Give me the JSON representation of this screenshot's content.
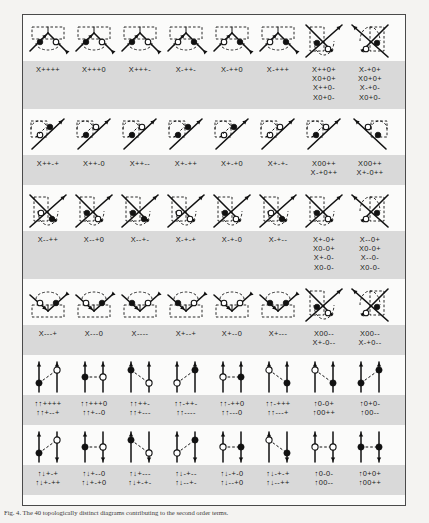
{
  "figure": {
    "caption": "Fig. 4. The 40 topologically distinct diagrams contributing to the second order terms.",
    "frame_color": "#4a4a4a",
    "band_color": "#d9d9d9",
    "paper_color": "#f4f3f1",
    "ink_color": "#111111"
  },
  "groups": [
    {
      "id": "group-1",
      "band": "gray",
      "diagrams": [
        {
          "id": "d1",
          "kind": "vertex-pair",
          "a": "filled",
          "b": "open",
          "arc": "below"
        },
        {
          "id": "d2",
          "kind": "vertex-pair",
          "a": "filled",
          "b": "open",
          "arc": "below"
        },
        {
          "id": "d3",
          "kind": "vertex-pair",
          "a": "filled",
          "b": "open",
          "arc": "below"
        },
        {
          "id": "d4",
          "kind": "vertex-pair",
          "a": "open",
          "b": "filled",
          "arc": "below"
        },
        {
          "id": "d5",
          "kind": "vertex-pair",
          "a": "open",
          "b": "filled",
          "arc": "below"
        },
        {
          "id": "d6",
          "kind": "vertex-pair",
          "a": "open",
          "b": "filled",
          "arc": "below"
        },
        {
          "id": "d7",
          "kind": "cross-left",
          "a": "filled",
          "b": "open",
          "arc": "right"
        },
        {
          "id": "d8",
          "kind": "cross-right",
          "a": "filled",
          "b": "open",
          "arc": "left"
        }
      ],
      "labels": [
        [
          "X++++"
        ],
        [
          "X+++0"
        ],
        [
          "X+++-"
        ],
        [
          "X-++-"
        ],
        [
          "X-++0"
        ],
        [
          "X-+++"
        ],
        [
          "X++0+",
          "X0+0+",
          "X++0-",
          "X0+0-"
        ],
        [
          "X-+0+",
          "X0+0+",
          "X-+0-",
          "X0+0-"
        ]
      ]
    },
    {
      "id": "group-2",
      "band": "gray",
      "diagrams": [
        {
          "id": "d9",
          "kind": "fork-up",
          "a": "open",
          "b": "filled"
        },
        {
          "id": "d10",
          "kind": "fork-up",
          "a": "filled",
          "b": "open"
        },
        {
          "id": "d11",
          "kind": "fork-up",
          "a": "filled",
          "b": "open"
        },
        {
          "id": "d12",
          "kind": "fork-up",
          "a": "filled",
          "b": "filled"
        },
        {
          "id": "d13",
          "kind": "fork-up",
          "a": "open",
          "b": "filled"
        },
        {
          "id": "d14",
          "kind": "fork-up",
          "a": "open",
          "b": "open"
        },
        {
          "id": "d15",
          "kind": "fork-up",
          "a": "filled",
          "b": "open"
        },
        {
          "id": "d16",
          "kind": "fork-up-r",
          "a": "filled",
          "b": "open"
        }
      ],
      "labels": [
        [
          "X++-+"
        ],
        [
          "X++-0"
        ],
        [
          "X++--"
        ],
        [
          "X+-++"
        ],
        [
          "X+-+0"
        ],
        [
          "X+-+-"
        ],
        [
          "X00++",
          "X-+0++"
        ],
        [
          "X00++",
          "X+-0++"
        ]
      ]
    },
    {
      "id": "group-3",
      "band": "gray",
      "diagrams": [
        {
          "id": "d17",
          "kind": "cross-left",
          "a": "open",
          "b": "filled",
          "arc": "right"
        },
        {
          "id": "d18",
          "kind": "cross-left",
          "a": "filled",
          "b": "open",
          "arc": "right"
        },
        {
          "id": "d19",
          "kind": "cross-left",
          "a": "filled",
          "b": "filled",
          "arc": "right"
        },
        {
          "id": "d20",
          "kind": "cross-left",
          "a": "open",
          "b": "open",
          "arc": "right"
        },
        {
          "id": "d21",
          "kind": "cross-left",
          "a": "filled",
          "b": "open",
          "arc": "right"
        },
        {
          "id": "d22",
          "kind": "cross-left",
          "a": "open",
          "b": "filled",
          "arc": "right"
        },
        {
          "id": "d23",
          "kind": "cross-left",
          "a": "filled",
          "b": "open",
          "arc": "right"
        },
        {
          "id": "d24",
          "kind": "cross-right",
          "a": "filled",
          "b": "open",
          "arc": "left"
        }
      ],
      "labels": [
        [
          "X--++"
        ],
        [
          "X--+0"
        ],
        [
          "X--+-"
        ],
        [
          "X-+-+"
        ],
        [
          "X-+-0"
        ],
        [
          "X-+--"
        ],
        [
          "X+-0+",
          "X0-0+",
          "X+-0-",
          "X0-0-"
        ],
        [
          "X--0+",
          "X0-0+",
          "X--0-",
          "X0-0-"
        ]
      ]
    },
    {
      "id": "group-4",
      "band": "gray",
      "diagrams": [
        {
          "id": "d25",
          "kind": "vertex-pair",
          "a": "open",
          "b": "filled",
          "arc": "above"
        },
        {
          "id": "d26",
          "kind": "vertex-pair",
          "a": "open",
          "b": "filled",
          "arc": "above"
        },
        {
          "id": "d27",
          "kind": "vertex-pair",
          "a": "filled",
          "b": "open",
          "arc": "above"
        },
        {
          "id": "d28",
          "kind": "vertex-pair",
          "a": "filled",
          "b": "open",
          "arc": "above"
        },
        {
          "id": "d29",
          "kind": "vertex-pair",
          "a": "open",
          "b": "open",
          "arc": "above"
        },
        {
          "id": "d30",
          "kind": "vertex-pair",
          "a": "filled",
          "b": "filled",
          "arc": "above"
        },
        {
          "id": "d31",
          "kind": "cross-left",
          "a": "filled",
          "b": "open",
          "arc": "right"
        },
        {
          "id": "d32",
          "kind": "cross-right",
          "a": "filled",
          "b": "open",
          "arc": "left"
        }
      ],
      "labels": [
        [
          "X---+"
        ],
        [
          "X---0"
        ],
        [
          "X----"
        ],
        [
          "X+--+"
        ],
        [
          "X+--0"
        ],
        [
          "X+---"
        ],
        [
          "X00--",
          "X+-0--"
        ],
        [
          "X00--",
          "X-+0--"
        ]
      ]
    },
    {
      "id": "group-5",
      "band": "gray",
      "diagrams": [
        {
          "id": "d33",
          "kind": "ladder",
          "left": "filled",
          "right": "open",
          "lpos": "low",
          "rpos": "high",
          "ltop": "up",
          "rtop": "up"
        },
        {
          "id": "d34",
          "kind": "ladder",
          "left": "filled",
          "right": "open",
          "lpos": "mid",
          "rpos": "mid",
          "ltop": "up",
          "rtop": "up"
        },
        {
          "id": "d35",
          "kind": "ladder",
          "left": "filled",
          "right": "open",
          "lpos": "high",
          "rpos": "low",
          "ltop": "up",
          "rtop": "up"
        },
        {
          "id": "d36",
          "kind": "ladder",
          "left": "open",
          "right": "filled",
          "lpos": "low",
          "rpos": "high",
          "ltop": "up",
          "rtop": "up"
        },
        {
          "id": "d37",
          "kind": "ladder",
          "left": "open",
          "right": "filled",
          "lpos": "mid",
          "rpos": "mid",
          "ltop": "up",
          "rtop": "up"
        },
        {
          "id": "d38",
          "kind": "ladder",
          "left": "open",
          "right": "filled",
          "lpos": "high",
          "rpos": "low",
          "ltop": "up",
          "rtop": "up"
        },
        {
          "id": "d39",
          "kind": "ladder",
          "left": "open",
          "right": "filled",
          "lpos": "high",
          "rpos": "low",
          "ltop": "up",
          "rtop": "up"
        },
        {
          "id": "d40",
          "kind": "ladder",
          "left": "filled",
          "right": "filled",
          "lpos": "low",
          "rpos": "high",
          "ltop": "up",
          "rtop": "up"
        }
      ],
      "labels": [
        [
          "↑↑++++",
          "↑↑+--+"
        ],
        [
          "↑↑+++0",
          "↑↑+--0"
        ],
        [
          "↑↑++-",
          "↑↑+---"
        ],
        [
          "↑↑-++-",
          "↑↑----"
        ],
        [
          "↑↑-++0",
          "↑↑---0"
        ],
        [
          "↑↑-+++",
          "↑↑---+"
        ],
        [
          "↑0-0+",
          "↑00++"
        ],
        [
          "↑0+0-",
          "↑00--"
        ]
      ]
    },
    {
      "id": "group-6",
      "band": "gray",
      "diagrams": [
        {
          "id": "d41",
          "kind": "ladder",
          "left": "filled",
          "right": "open",
          "lpos": "low",
          "rpos": "high",
          "ltop": "up",
          "rtop": "down"
        },
        {
          "id": "d42",
          "kind": "ladder",
          "left": "filled",
          "right": "open",
          "lpos": "mid",
          "rpos": "mid",
          "ltop": "up",
          "rtop": "down"
        },
        {
          "id": "d43",
          "kind": "ladder",
          "left": "filled",
          "right": "open",
          "lpos": "high",
          "rpos": "low",
          "ltop": "up",
          "rtop": "down"
        },
        {
          "id": "d44",
          "kind": "ladder",
          "left": "open",
          "right": "filled",
          "lpos": "low",
          "rpos": "high",
          "ltop": "up",
          "rtop": "down"
        },
        {
          "id": "d45",
          "kind": "ladder",
          "left": "open",
          "right": "filled",
          "lpos": "mid",
          "rpos": "mid",
          "ltop": "up",
          "rtop": "down"
        },
        {
          "id": "d46",
          "kind": "ladder",
          "left": "open",
          "right": "filled",
          "lpos": "high",
          "rpos": "low",
          "ltop": "up",
          "rtop": "down"
        },
        {
          "id": "d47",
          "kind": "ladder",
          "left": "open",
          "right": "open",
          "lpos": "mid",
          "rpos": "mid",
          "ltop": "up",
          "rtop": "down"
        },
        {
          "id": "d48",
          "kind": "ladder",
          "left": "filled",
          "right": "filled",
          "lpos": "mid",
          "rpos": "mid",
          "ltop": "up",
          "rtop": "down"
        }
      ],
      "labels": [
        [
          "↑↓+-+",
          "↑↓+-++"
        ],
        [
          "↑↓+--0",
          "↑↓+-+0"
        ],
        [
          "↑↓+---",
          "↑↓+-+-"
        ],
        [
          "↑↓-+--",
          "↑↓--+-"
        ],
        [
          "↑↓-+-0",
          "↑↓--+0"
        ],
        [
          "↑↓-+-+",
          "↑↓--++"
        ],
        [
          "↑0-0-",
          "↑00--"
        ],
        [
          "↑0+0+",
          "↑00++"
        ]
      ]
    }
  ]
}
